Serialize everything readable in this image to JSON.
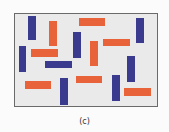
{
  "figure": {
    "caption": "(c)",
    "colors": {
      "blue": "#3a3a8e",
      "orange": "#e8623a",
      "background": "#eaeaea",
      "border": "#6a6a6a"
    },
    "bars": [
      {
        "color": "blue",
        "orientation": "vertical",
        "x": 28,
        "y": 16,
        "w": 8,
        "h": 24
      },
      {
        "color": "orange",
        "orientation": "vertical",
        "x": 49,
        "y": 21,
        "w": 8,
        "h": 25
      },
      {
        "color": "orange",
        "orientation": "horizontal",
        "x": 79,
        "y": 18,
        "w": 26,
        "h": 8
      },
      {
        "color": "blue",
        "orientation": "vertical",
        "x": 136,
        "y": 18,
        "w": 8,
        "h": 25
      },
      {
        "color": "blue",
        "orientation": "vertical",
        "x": 19,
        "y": 46,
        "w": 7,
        "h": 26
      },
      {
        "color": "orange",
        "orientation": "horizontal",
        "x": 31,
        "y": 49,
        "w": 27,
        "h": 8
      },
      {
        "color": "blue",
        "orientation": "vertical",
        "x": 73,
        "y": 32,
        "w": 8,
        "h": 26
      },
      {
        "color": "orange",
        "orientation": "vertical",
        "x": 90,
        "y": 41,
        "w": 8,
        "h": 25
      },
      {
        "color": "orange",
        "orientation": "horizontal",
        "x": 103,
        "y": 39,
        "w": 27,
        "h": 7
      },
      {
        "color": "blue",
        "orientation": "horizontal",
        "x": 45,
        "y": 61,
        "w": 27,
        "h": 7
      },
      {
        "color": "blue",
        "orientation": "vertical",
        "x": 127,
        "y": 56,
        "w": 8,
        "h": 26
      },
      {
        "color": "orange",
        "orientation": "horizontal",
        "x": 25,
        "y": 81,
        "w": 26,
        "h": 8
      },
      {
        "color": "blue",
        "orientation": "vertical",
        "x": 60,
        "y": 78,
        "w": 8,
        "h": 27
      },
      {
        "color": "orange",
        "orientation": "horizontal",
        "x": 76,
        "y": 76,
        "w": 26,
        "h": 7
      },
      {
        "color": "blue",
        "orientation": "vertical",
        "x": 112,
        "y": 75,
        "w": 8,
        "h": 26
      },
      {
        "color": "orange",
        "orientation": "horizontal",
        "x": 124,
        "y": 88,
        "w": 27,
        "h": 8
      }
    ]
  }
}
